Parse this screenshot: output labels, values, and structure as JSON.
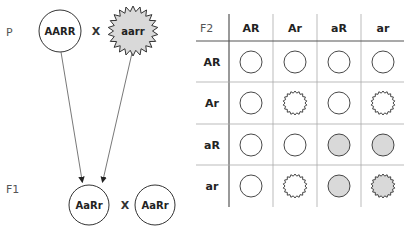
{
  "parents": {
    "label": "P",
    "cross": "X",
    "left": {
      "genotype": "AARR",
      "shape": "circle",
      "fill": "#ffffff"
    },
    "right": {
      "genotype": "aarr",
      "shape": "star",
      "fill": "#d9d9d9"
    }
  },
  "f1": {
    "label": "F1",
    "cross": "X",
    "left": {
      "genotype": "AaRr",
      "shape": "circle",
      "fill": "#ffffff"
    },
    "right": {
      "genotype": "AaRr",
      "shape": "circle",
      "fill": "#ffffff"
    }
  },
  "punnett": {
    "corner_label": "F2",
    "col_headers": [
      "AR",
      "Ar",
      "aR",
      "ar"
    ],
    "row_headers": [
      "AR",
      "Ar",
      "aR",
      "ar"
    ],
    "cells": [
      [
        {
          "shape": "circle",
          "fill": "white"
        },
        {
          "shape": "circle",
          "fill": "white"
        },
        {
          "shape": "circle",
          "fill": "white"
        },
        {
          "shape": "circle",
          "fill": "white"
        }
      ],
      [
        {
          "shape": "circle",
          "fill": "white"
        },
        {
          "shape": "star",
          "fill": "white"
        },
        {
          "shape": "circle",
          "fill": "white"
        },
        {
          "shape": "star",
          "fill": "white"
        }
      ],
      [
        {
          "shape": "circle",
          "fill": "white"
        },
        {
          "shape": "circle",
          "fill": "white"
        },
        {
          "shape": "circle",
          "fill": "gray"
        },
        {
          "shape": "circle",
          "fill": "gray"
        }
      ],
      [
        {
          "shape": "circle",
          "fill": "white"
        },
        {
          "shape": "star",
          "fill": "white"
        },
        {
          "shape": "circle",
          "fill": "gray"
        },
        {
          "shape": "star",
          "fill": "gray"
        }
      ]
    ]
  },
  "colors": {
    "gray_fill": "#d9d9d9",
    "white_fill": "#ffffff",
    "stroke": "#333333",
    "grid": "#555555"
  }
}
